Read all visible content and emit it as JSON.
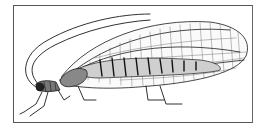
{
  "figure": {
    "style": "black ink engraving on white",
    "parts": [
      "antennae",
      "head",
      "thorax",
      "abdomen",
      "wings",
      "legs"
    ],
    "colors": {
      "ink": "#1a1a1a",
      "paper": "#ffffff",
      "frame": "#555555"
    }
  }
}
